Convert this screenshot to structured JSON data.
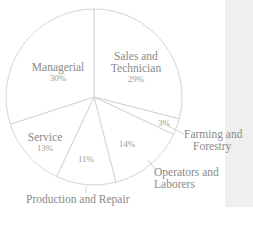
{
  "chart_data": {
    "type": "pie",
    "title": "",
    "start_angle": "top, clockwise",
    "categories": [
      "Sales and Technician",
      "Farming and Forestry",
      "Operators and Laborers",
      "Production and Repair",
      "Service",
      "Managerial"
    ],
    "values": [
      29,
      3,
      14,
      11,
      13,
      30
    ],
    "labels": {
      "sales": {
        "name_line1": "Sales and",
        "name_line2": "Technician",
        "pct": "29%"
      },
      "farming": {
        "name_line1": "Farming and",
        "name_line2": "Forestry",
        "pct": "3%"
      },
      "operators": {
        "name_line1": "Operators and",
        "name_line2": "Laborers",
        "pct": "14%"
      },
      "production": {
        "name_line1": "Production and Repair",
        "pct": "11%"
      },
      "service": {
        "name_line1": "Service",
        "pct": "13%"
      },
      "managerial": {
        "name_line1": "Managerial",
        "pct": "30%"
      }
    },
    "colors": {
      "fill": "#ffffff",
      "stroke": "#d0d0d0",
      "text": "#8a8a8a"
    }
  }
}
